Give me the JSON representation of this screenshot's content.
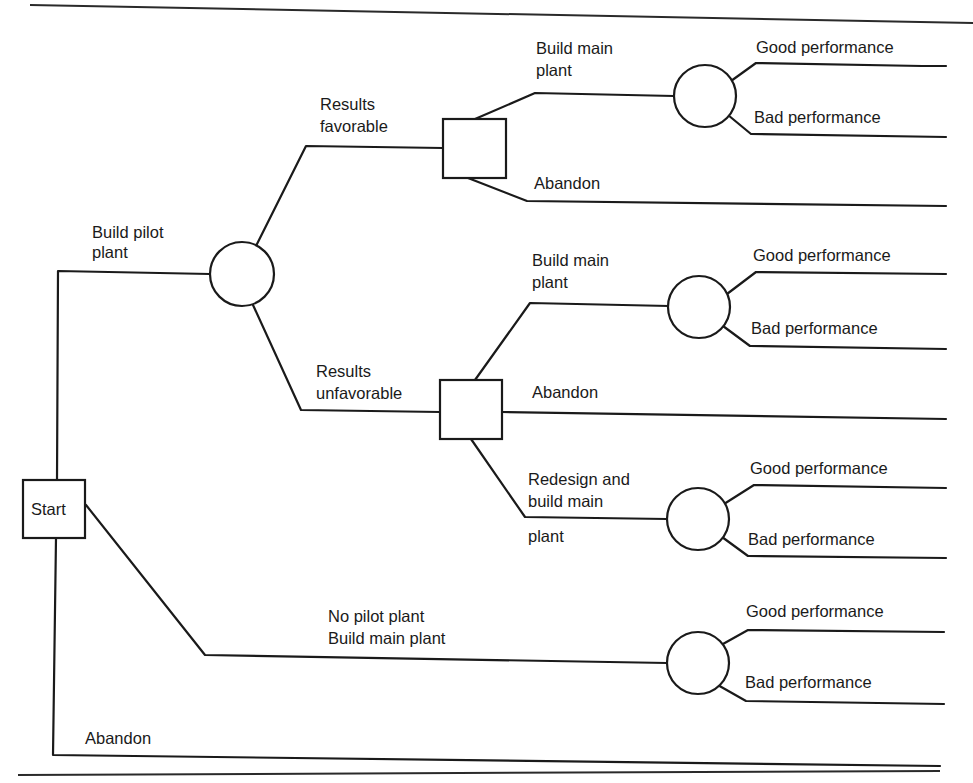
{
  "diagram": {
    "type": "decision-tree",
    "colors": {
      "ink": "#1a1a1a",
      "background": "#ffffff"
    },
    "start": {
      "label": "Start",
      "kind": "decision"
    },
    "branches": {
      "build_pilot": {
        "label_line1": "Build pilot",
        "label_line2": "plant"
      },
      "results_favorable": {
        "label_line1": "Results",
        "label_line2": "favorable"
      },
      "results_unfavorable": {
        "label_line1": "Results",
        "label_line2": "unfavorable"
      },
      "fav_build_main": {
        "label_line1": "Build main",
        "label_line2": "plant"
      },
      "fav_abandon": {
        "label": "Abandon"
      },
      "unfav_build_main": {
        "label_line1": "Build main",
        "label_line2": "plant"
      },
      "unfav_abandon": {
        "label": "Abandon"
      },
      "unfav_redesign": {
        "label_line1": "Redesign and",
        "label_line2": "build main",
        "label_line3": "plant"
      },
      "no_pilot": {
        "label_line1": "No pilot plant",
        "label_line2": "Build main plant"
      },
      "abandon": {
        "label": "Abandon"
      }
    },
    "outcomes": [
      {
        "good": "Good performance",
        "bad": "Bad performance"
      },
      {
        "good": "Good performance",
        "bad": "Bad performance"
      },
      {
        "good": "Good performance",
        "bad": "Bad performance"
      },
      {
        "good": "Good performance",
        "bad": "Bad performance"
      }
    ],
    "legend": {
      "square": "decision node",
      "circle": "chance node"
    }
  }
}
